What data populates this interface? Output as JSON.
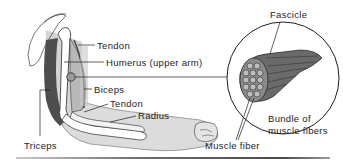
{
  "diagram": {
    "labels": {
      "tendon_upper": "Tendon",
      "humerus": "Humerus (upper arm)",
      "biceps": "Biceps",
      "tendon_lower": "Tendon",
      "radius": "Radius",
      "triceps": "Triceps",
      "fascicle": "Fascicle",
      "bundle_line1": "Bundle of",
      "bundle_line2": "muscle fibers",
      "muscle_fiber": "Muscle fiber"
    },
    "colors": {
      "line": "#1e1e1e",
      "muscle_dark": "#5a5a5a",
      "muscle_light": "#bdbdbd",
      "skin": "#dcdcdc",
      "bone": "#ffffff"
    }
  }
}
